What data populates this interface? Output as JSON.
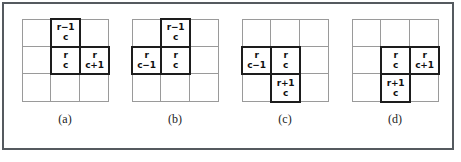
{
  "figure": {
    "background_color": "#ffffff",
    "frame_color": "#555a5f",
    "grid_line_color": "#9a9a9a",
    "highlight_border_color": "#1d1d1d",
    "text_color": "#101010",
    "grid_rows": 3,
    "grid_columns": 3,
    "panel_count": 4
  },
  "panels": [
    {
      "label": "(a)",
      "name": "panel-a",
      "cells": [
        {
          "row": 0,
          "col": 0,
          "highlighted": false,
          "line1": "",
          "line2": ""
        },
        {
          "row": 0,
          "col": 1,
          "highlighted": true,
          "line1": "r−1",
          "line2": "c"
        },
        {
          "row": 0,
          "col": 2,
          "highlighted": false,
          "line1": "",
          "line2": ""
        },
        {
          "row": 1,
          "col": 0,
          "highlighted": false,
          "line1": "",
          "line2": ""
        },
        {
          "row": 1,
          "col": 1,
          "highlighted": true,
          "line1": "r",
          "line2": "c"
        },
        {
          "row": 1,
          "col": 2,
          "highlighted": true,
          "line1": "r",
          "line2": "c+1"
        },
        {
          "row": 2,
          "col": 0,
          "highlighted": false,
          "line1": "",
          "line2": ""
        },
        {
          "row": 2,
          "col": 1,
          "highlighted": false,
          "line1": "",
          "line2": ""
        },
        {
          "row": 2,
          "col": 2,
          "highlighted": false,
          "line1": "",
          "line2": ""
        }
      ]
    },
    {
      "label": "(b)",
      "name": "panel-b",
      "cells": [
        {
          "row": 0,
          "col": 0,
          "highlighted": false,
          "line1": "",
          "line2": ""
        },
        {
          "row": 0,
          "col": 1,
          "highlighted": true,
          "line1": "r−1",
          "line2": "c"
        },
        {
          "row": 0,
          "col": 2,
          "highlighted": false,
          "line1": "",
          "line2": ""
        },
        {
          "row": 1,
          "col": 0,
          "highlighted": true,
          "line1": "r",
          "line2": "c−1"
        },
        {
          "row": 1,
          "col": 1,
          "highlighted": true,
          "line1": "r",
          "line2": "c"
        },
        {
          "row": 1,
          "col": 2,
          "highlighted": false,
          "line1": "",
          "line2": ""
        },
        {
          "row": 2,
          "col": 0,
          "highlighted": false,
          "line1": "",
          "line2": ""
        },
        {
          "row": 2,
          "col": 1,
          "highlighted": false,
          "line1": "",
          "line2": ""
        },
        {
          "row": 2,
          "col": 2,
          "highlighted": false,
          "line1": "",
          "line2": ""
        }
      ]
    },
    {
      "label": "(c)",
      "name": "panel-c",
      "cells": [
        {
          "row": 0,
          "col": 0,
          "highlighted": false,
          "line1": "",
          "line2": ""
        },
        {
          "row": 0,
          "col": 1,
          "highlighted": false,
          "line1": "",
          "line2": ""
        },
        {
          "row": 0,
          "col": 2,
          "highlighted": false,
          "line1": "",
          "line2": ""
        },
        {
          "row": 1,
          "col": 0,
          "highlighted": true,
          "line1": "r",
          "line2": "c−1"
        },
        {
          "row": 1,
          "col": 1,
          "highlighted": true,
          "line1": "r",
          "line2": "c"
        },
        {
          "row": 1,
          "col": 2,
          "highlighted": false,
          "line1": "",
          "line2": ""
        },
        {
          "row": 2,
          "col": 0,
          "highlighted": false,
          "line1": "",
          "line2": ""
        },
        {
          "row": 2,
          "col": 1,
          "highlighted": true,
          "line1": "r+1",
          "line2": "c"
        },
        {
          "row": 2,
          "col": 2,
          "highlighted": false,
          "line1": "",
          "line2": ""
        }
      ]
    },
    {
      "label": "(d)",
      "name": "panel-d",
      "cells": [
        {
          "row": 0,
          "col": 0,
          "highlighted": false,
          "line1": "",
          "line2": ""
        },
        {
          "row": 0,
          "col": 1,
          "highlighted": false,
          "line1": "",
          "line2": ""
        },
        {
          "row": 0,
          "col": 2,
          "highlighted": false,
          "line1": "",
          "line2": ""
        },
        {
          "row": 1,
          "col": 0,
          "highlighted": false,
          "line1": "",
          "line2": ""
        },
        {
          "row": 1,
          "col": 1,
          "highlighted": true,
          "line1": "r",
          "line2": "c"
        },
        {
          "row": 1,
          "col": 2,
          "highlighted": true,
          "line1": "r",
          "line2": "c+1"
        },
        {
          "row": 2,
          "col": 0,
          "highlighted": false,
          "line1": "",
          "line2": ""
        },
        {
          "row": 2,
          "col": 1,
          "highlighted": true,
          "line1": "r+1",
          "line2": "c"
        },
        {
          "row": 2,
          "col": 2,
          "highlighted": false,
          "line1": "",
          "line2": ""
        }
      ]
    }
  ]
}
